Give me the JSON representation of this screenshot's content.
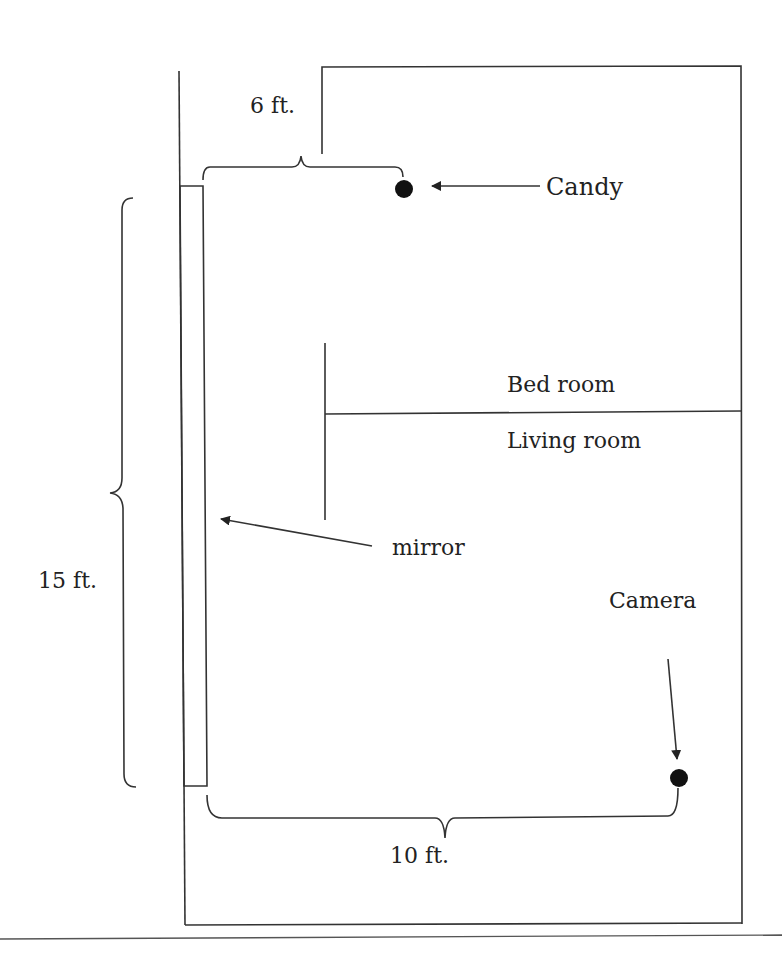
{
  "diagram": {
    "type": "floor-plan",
    "colors": {
      "line": "#333333",
      "text": "#222222",
      "background": "#ffffff"
    },
    "labels": {
      "candy": "Candy",
      "bedroom": "Bed room",
      "living_room": "Living room",
      "mirror": "mirror",
      "camera": "Camera",
      "dim_6": "6 ft.",
      "dim_15": "15 ft.",
      "dim_10": "10 ft."
    },
    "objects": [
      {
        "name": "candy",
        "shape": "dot",
        "x": 404,
        "y": 189
      },
      {
        "name": "camera",
        "shape": "dot",
        "x": 679,
        "y": 778
      },
      {
        "name": "mirror",
        "shape": "rect",
        "x_range": [
          181,
          206
        ],
        "y_range": [
          186,
          786
        ]
      }
    ],
    "dimensions": [
      {
        "label": "6 ft.",
        "from": "mirror-top",
        "to": "candy",
        "orientation": "horizontal"
      },
      {
        "label": "15 ft.",
        "from": "mirror-top",
        "to": "mirror-bottom",
        "orientation": "vertical"
      },
      {
        "label": "10 ft.",
        "from": "mirror-bottom",
        "to": "camera",
        "orientation": "horizontal"
      }
    ]
  }
}
